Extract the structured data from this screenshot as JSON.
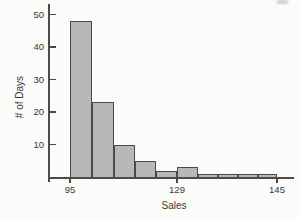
{
  "figure": {
    "background": "#fbfbfa",
    "bar_fill": "#b8b8b6",
    "bar_border": "#4a4a4a",
    "axis_color": "#4a4a4a",
    "text_color": "#383838"
  },
  "chart_data": {
    "type": "bar",
    "subtype": "histogram",
    "title": "",
    "xlabel": "Sales",
    "ylabel": "# of Days",
    "num_bins": 10,
    "values": [
      48,
      23,
      10,
      5,
      2,
      3,
      1,
      1,
      1,
      1
    ],
    "y_ticks": [
      10,
      20,
      30,
      40,
      50
    ],
    "ylim": [
      0,
      50
    ],
    "x_ticks": [
      {
        "label": "95",
        "edge_index": 0
      },
      {
        "label": "129",
        "edge_index": 5
      },
      {
        "label": "145",
        "edge_index": 10
      }
    ],
    "grid": false,
    "legend": false
  }
}
